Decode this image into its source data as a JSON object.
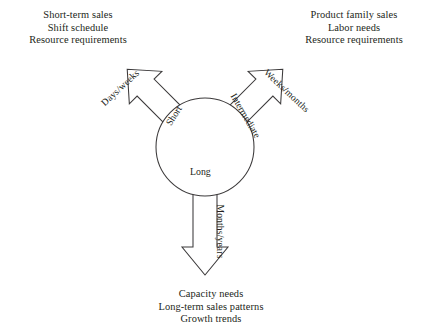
{
  "diagram": {
    "stroke_color": "#3c3a3b",
    "fill_color": "#ffffff",
    "text_color": "#231f20",
    "center": {
      "label_short": "Short",
      "label_intermediate": "Intermediate",
      "label_long": "Long"
    },
    "branches": [
      {
        "id": "short-range",
        "horizon": "Short",
        "timeframe": "Days/weeks",
        "direction": "up-left",
        "outputs": [
          "Short-term sales",
          "Shift schedule",
          "Resource requirements"
        ]
      },
      {
        "id": "intermediate-range",
        "horizon": "Intermediate",
        "timeframe": "Weeks/months",
        "direction": "up-right",
        "outputs": [
          "Product family sales",
          "Labor needs",
          "Resource requirements"
        ]
      },
      {
        "id": "long-range",
        "horizon": "Long",
        "timeframe": "Months/years",
        "direction": "down",
        "outputs": [
          "Capacity needs",
          "Long-term sales patterns",
          "Growth trends"
        ]
      }
    ]
  }
}
